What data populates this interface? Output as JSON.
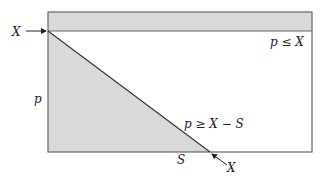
{
  "diagram": {
    "colors": {
      "shade": "#d9d9d9",
      "border": "#666666",
      "text": "#222222",
      "background": "#ffffff"
    },
    "labels": {
      "x_left": "X",
      "p_le_x": "p ≤ X",
      "p_axis": "p",
      "p_ge_x_minus_s": "p ≥ X − S",
      "s_axis": "S",
      "x_bottom": "X"
    },
    "regions": [
      {
        "name": "top-band",
        "description": "region p > X",
        "shaded": true
      },
      {
        "name": "lower-left-triangle",
        "description": "region p < X − S",
        "shaded": true
      },
      {
        "name": "feasible-region",
        "description": "X − S ≤ p ≤ X",
        "shaded": false
      }
    ],
    "arrows": [
      {
        "name": "x-left-arrow",
        "points_to": "X level on p axis"
      },
      {
        "name": "x-bottom-arrow",
        "points_to": "S = X on S axis"
      }
    ]
  }
}
